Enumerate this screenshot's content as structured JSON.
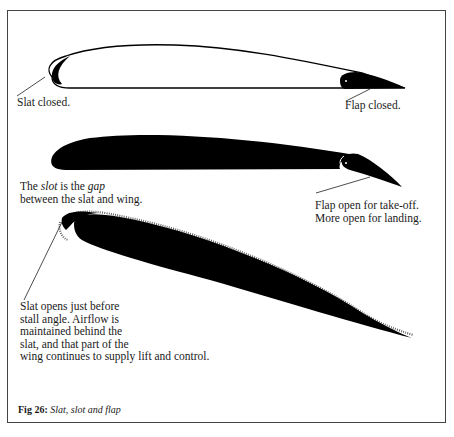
{
  "figure": {
    "number_label": "Fig 26:",
    "title": "Slat, slot and flap"
  },
  "diagrams": [
    {
      "id": "closed",
      "labels": {
        "slat": "Slat closed.",
        "flap": "Flap closed."
      }
    },
    {
      "id": "flap-open",
      "labels": {
        "slot_prefix": "The ",
        "slot_term": "slot",
        "slot_mid": " is the ",
        "gap_term": "gap",
        "slot_line2": "between the slat and wing.",
        "flap_line1": "Flap open for take-off.",
        "flap_line2": "More open for landing."
      }
    },
    {
      "id": "slat-open",
      "labels": {
        "lines": [
          "Slat opens just before",
          "stall angle. Airflow is",
          "maintained behind the",
          "slat, and that part of the",
          "wing continues to supply lift and control."
        ]
      }
    }
  ],
  "colors": {
    "ink": "#000000",
    "frame": "#444444",
    "paper": "#ffffff"
  }
}
